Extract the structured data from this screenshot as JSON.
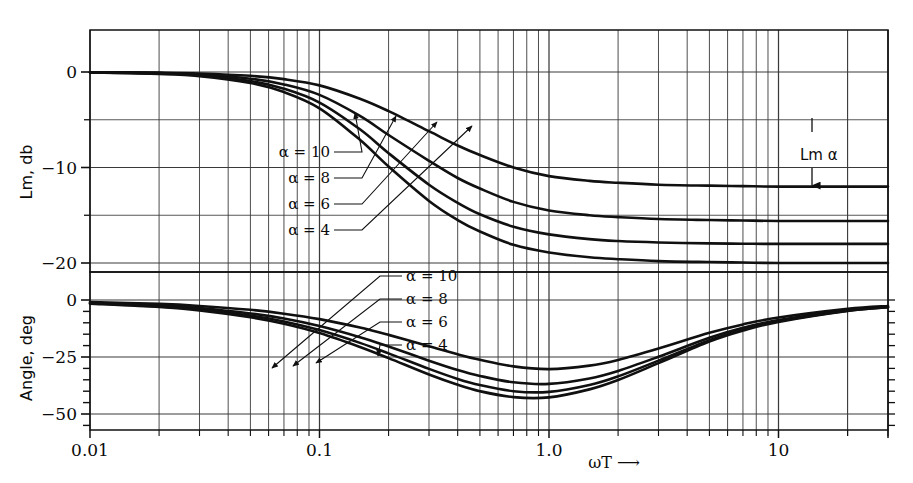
{
  "figure": {
    "background_color": "#ffffff",
    "ink_color": "#101010",
    "grid_color": "#3a3a3a"
  },
  "axes": {
    "x": {
      "label": "ωT",
      "label_arrow": "⟶",
      "scale": "log",
      "min": 0.01,
      "max": 30,
      "tick_labels": [
        "0.01",
        "0.1",
        "1.0",
        "10"
      ],
      "tick_values": [
        0.01,
        0.1,
        1.0,
        10
      ]
    },
    "y_top": {
      "label": "Lm, db",
      "min": -23,
      "max": 4.5,
      "tick_labels": [
        "0",
        "−10",
        "−20"
      ],
      "tick_values": [
        0,
        -10,
        -20
      ],
      "minor_tick_values": [
        -5,
        -15
      ]
    },
    "y_bottom": {
      "label": "Angle, deg",
      "min": -57,
      "max": 4,
      "tick_labels": [
        "0",
        "−25",
        "−50"
      ],
      "tick_values": [
        0,
        -25,
        -50
      ],
      "minor_tick_values": [
        -5,
        -10,
        -15,
        -20,
        -30,
        -35,
        -40,
        -45,
        -55
      ]
    }
  },
  "annotations": {
    "lm_alpha": {
      "text": "Lm α",
      "target_db": -12.2
    }
  },
  "chart_data": {
    "type": "line",
    "title": "",
    "subtitle": "",
    "xlabel": "ωT",
    "ylabel": "Lm, db / Angle, deg",
    "xscale": "log",
    "xlim": [
      0.01,
      30
    ],
    "grid": true,
    "legend_position": "inline-leader-labels",
    "panels": [
      {
        "name": "magnitude",
        "ylabel": "Lm, db",
        "ylim": [
          -23,
          4.5
        ],
        "yticks": [
          0,
          -10,
          -20
        ],
        "labels": [
          {
            "text": "α = 10",
            "alpha": 10
          },
          {
            "text": "α = 8",
            "alpha": 8
          },
          {
            "text": "α = 6",
            "alpha": 6
          },
          {
            "text": "α = 4",
            "alpha": 4
          }
        ],
        "series": [
          {
            "name": "α = 4",
            "alpha": 4,
            "asymptote_db": -12.0,
            "x": [
              0.01,
              0.02,
              0.03,
              0.05,
              0.07,
              0.1,
              0.15,
              0.2,
              0.3,
              0.4,
              0.5,
              0.7,
              1.0,
              1.5,
              2.0,
              3.0,
              5.0,
              7.0,
              10.0,
              20.0,
              30.0
            ],
            "values": [
              -0.02,
              -0.07,
              -0.15,
              -0.4,
              -0.75,
              -1.4,
              -2.8,
              -4.1,
              -6.2,
              -7.7,
              -8.7,
              -10.0,
              -10.9,
              -11.4,
              -11.6,
              -11.8,
              -11.9,
              -11.95,
              -12.0,
              -12.0,
              -12.0
            ]
          },
          {
            "name": "α = 6",
            "alpha": 6,
            "asymptote_db": -15.6,
            "x": [
              0.01,
              0.02,
              0.03,
              0.05,
              0.07,
              0.1,
              0.15,
              0.2,
              0.3,
              0.4,
              0.5,
              0.7,
              1.0,
              1.5,
              2.0,
              3.0,
              5.0,
              7.0,
              10.0,
              20.0,
              30.0
            ],
            "values": [
              -0.03,
              -0.12,
              -0.26,
              -0.7,
              -1.3,
              -2.4,
              -4.6,
              -6.6,
              -9.3,
              -11.1,
              -12.2,
              -13.6,
              -14.5,
              -15.0,
              -15.2,
              -15.4,
              -15.5,
              -15.55,
              -15.6,
              -15.6,
              -15.6
            ]
          },
          {
            "name": "α = 8",
            "alpha": 8,
            "asymptote_db": -18.0,
            "x": [
              0.01,
              0.02,
              0.03,
              0.05,
              0.07,
              0.1,
              0.15,
              0.2,
              0.3,
              0.4,
              0.5,
              0.7,
              1.0,
              1.5,
              2.0,
              3.0,
              5.0,
              7.0,
              10.0,
              20.0,
              30.0
            ],
            "values": [
              -0.04,
              -0.16,
              -0.35,
              -0.95,
              -1.75,
              -3.2,
              -6.0,
              -8.5,
              -11.8,
              -13.7,
              -14.9,
              -16.2,
              -17.0,
              -17.5,
              -17.7,
              -17.85,
              -17.95,
              -17.98,
              -18.0,
              -18.0,
              -18.0
            ]
          },
          {
            "name": "α = 10",
            "alpha": 10,
            "asymptote_db": -20.0,
            "x": [
              0.01,
              0.02,
              0.03,
              0.05,
              0.07,
              0.1,
              0.15,
              0.2,
              0.3,
              0.4,
              0.5,
              0.7,
              1.0,
              1.5,
              2.0,
              3.0,
              5.0,
              7.0,
              10.0,
              20.0,
              30.0
            ],
            "values": [
              -0.05,
              -0.2,
              -0.43,
              -1.15,
              -2.1,
              -3.8,
              -7.1,
              -9.9,
              -13.5,
              -15.5,
              -16.7,
              -18.1,
              -18.9,
              -19.4,
              -19.6,
              -19.8,
              -19.9,
              -19.95,
              -20.0,
              -20.0,
              -20.0
            ]
          }
        ]
      },
      {
        "name": "phase",
        "ylabel": "Angle, deg",
        "ylim": [
          -57,
          4
        ],
        "yticks": [
          0,
          -25,
          -50
        ],
        "labels": [
          {
            "text": "α = 10",
            "alpha": 10
          },
          {
            "text": "α = 8",
            "alpha": 8
          },
          {
            "text": "α = 6",
            "alpha": 6
          },
          {
            "text": "α = 4",
            "alpha": 4
          }
        ],
        "series": [
          {
            "name": "α = 4",
            "alpha": 4,
            "min_deg": -37,
            "x": [
              0.01,
              0.02,
              0.03,
              0.05,
              0.07,
              0.1,
              0.15,
              0.2,
              0.3,
              0.4,
              0.5,
              0.7,
              1.0,
              1.5,
              2.0,
              3.0,
              5.0,
              7.0,
              10.0,
              20.0,
              30.0
            ],
            "values": [
              -0.9,
              -1.7,
              -2.6,
              -4.3,
              -6.0,
              -8.4,
              -12.1,
              -15.3,
              -20.3,
              -23.8,
              -26.2,
              -29.1,
              -30.3,
              -28.8,
              -26.3,
              -21.3,
              -14.4,
              -10.7,
              -7.7,
              -3.9,
              -2.6
            ]
          },
          {
            "name": "α = 6",
            "alpha": 6,
            "min_deg": -45,
            "x": [
              0.01,
              0.02,
              0.03,
              0.05,
              0.07,
              0.1,
              0.15,
              0.2,
              0.3,
              0.4,
              0.5,
              0.7,
              1.0,
              1.5,
              2.0,
              3.0,
              5.0,
              7.0,
              10.0,
              20.0,
              30.0
            ],
            "values": [
              -1.2,
              -2.4,
              -3.5,
              -5.9,
              -8.1,
              -11.4,
              -16.3,
              -20.4,
              -26.6,
              -30.7,
              -33.3,
              -36.1,
              -36.8,
              -34.4,
              -31.1,
              -24.9,
              -16.6,
              -12.2,
              -8.8,
              -4.4,
              -3.0
            ]
          },
          {
            "name": "α = 8",
            "alpha": 8,
            "min_deg": -49,
            "x": [
              0.01,
              0.02,
              0.03,
              0.05,
              0.07,
              0.1,
              0.15,
              0.2,
              0.3,
              0.4,
              0.5,
              0.7,
              1.0,
              1.5,
              2.0,
              3.0,
              5.0,
              7.0,
              10.0,
              20.0,
              30.0
            ],
            "values": [
              -1.4,
              -2.8,
              -4.1,
              -6.8,
              -9.4,
              -13.2,
              -18.8,
              -23.4,
              -30.2,
              -34.6,
              -37.3,
              -40.0,
              -40.3,
              -37.3,
              -33.5,
              -26.6,
              -17.6,
              -12.9,
              -9.3,
              -4.7,
              -3.1
            ]
          },
          {
            "name": "α = 10",
            "alpha": 10,
            "min_deg": -53,
            "x": [
              0.01,
              0.02,
              0.03,
              0.05,
              0.07,
              0.1,
              0.15,
              0.2,
              0.3,
              0.4,
              0.5,
              0.7,
              1.0,
              1.5,
              2.0,
              3.0,
              5.0,
              7.0,
              10.0,
              20.0,
              30.0
            ],
            "values": [
              -1.6,
              -3.1,
              -4.6,
              -7.6,
              -10.4,
              -14.5,
              -20.6,
              -25.5,
              -32.7,
              -37.2,
              -40.0,
              -42.6,
              -42.7,
              -39.2,
              -35.1,
              -27.7,
              -18.2,
              -13.4,
              -9.6,
              -4.8,
              -3.2
            ]
          }
        ]
      }
    ]
  }
}
